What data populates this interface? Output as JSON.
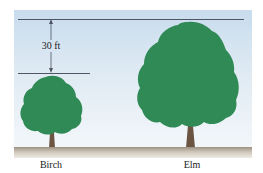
{
  "figure": {
    "dimension": {
      "label": "30 ft"
    },
    "trees": [
      {
        "name": "Birch"
      },
      {
        "name": "Elm"
      }
    ],
    "colors": {
      "foliage": "#2f8a55",
      "trunk": "#6b5442",
      "sky_top": "#c8dced",
      "sky_bottom": "#f3f7fa",
      "ground": "#b5ab9c",
      "line": "#4d5566"
    }
  }
}
